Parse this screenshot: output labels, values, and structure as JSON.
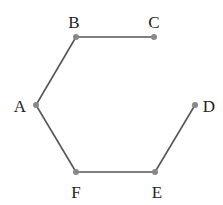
{
  "diagram": {
    "type": "open-hexagon-path",
    "line_color": "#555555",
    "point_color": "#888888",
    "nodes": [
      {
        "id": "A",
        "label": "A",
        "x": 36,
        "y": 105,
        "lx": 20,
        "ly": 112
      },
      {
        "id": "B",
        "label": "B",
        "x": 76,
        "y": 37,
        "lx": 74,
        "ly": 28
      },
      {
        "id": "C",
        "label": "C",
        "x": 154,
        "y": 37,
        "lx": 154,
        "ly": 28
      },
      {
        "id": "D",
        "label": "D",
        "x": 195,
        "y": 105,
        "lx": 209,
        "ly": 112
      },
      {
        "id": "E",
        "label": "E",
        "x": 155,
        "y": 172,
        "lx": 157,
        "ly": 198
      },
      {
        "id": "F",
        "label": "F",
        "x": 76,
        "y": 172,
        "lx": 76,
        "ly": 198
      }
    ],
    "edges": [
      [
        "B",
        "C"
      ],
      [
        "A",
        "B"
      ],
      [
        "A",
        "F"
      ],
      [
        "F",
        "E"
      ],
      [
        "E",
        "D"
      ]
    ]
  }
}
